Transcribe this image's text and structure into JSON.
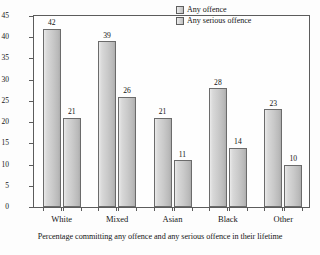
{
  "chart_data": {
    "type": "bar",
    "title": "",
    "xlabel": "Percentage committing any offence and any serious offence in their lifetime",
    "ylabel": "Percentage",
    "ylim": [
      0,
      45
    ],
    "ytick_step": 5,
    "yticks": [
      "45",
      "40",
      "35",
      "30",
      "25",
      "20",
      "15",
      "10",
      "5",
      "0"
    ],
    "grid": false,
    "legend_position": "top-right",
    "categories": [
      "White",
      "Mixed",
      "Asian",
      "Black",
      "Other"
    ],
    "series": [
      {
        "name": "Any offence",
        "values": [
          42,
          39,
          21,
          28,
          23
        ]
      },
      {
        "name": "Any serious offence",
        "values": [
          21,
          26,
          11,
          14,
          10
        ]
      }
    ]
  },
  "legend": {
    "items": [
      {
        "label": "Any offence"
      },
      {
        "label": "Any serious offence"
      }
    ]
  }
}
